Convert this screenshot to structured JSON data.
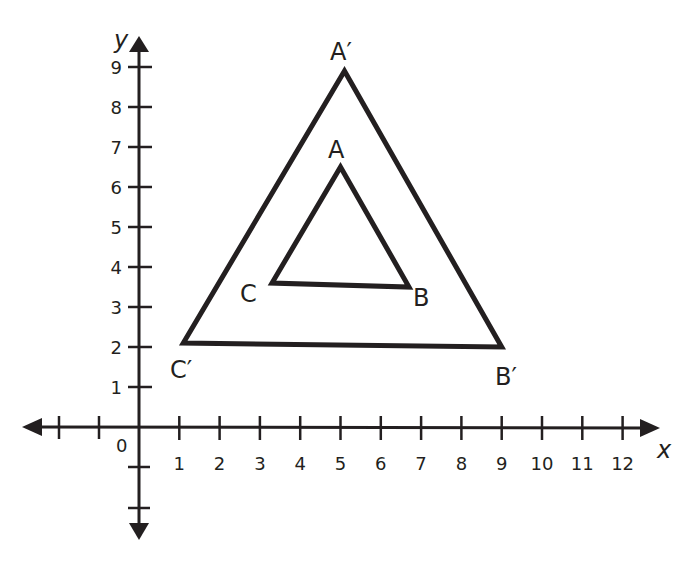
{
  "diagram": {
    "type": "coordinate-plane-dilation",
    "colors": {
      "ink": "#231f20",
      "background": "#ffffff"
    },
    "axes": {
      "x_label": "x",
      "y_label": "y",
      "origin_label": "0",
      "x_ticks": [
        "1",
        "2",
        "3",
        "4",
        "5",
        "6",
        "7",
        "8",
        "9",
        "10",
        "11",
        "12"
      ],
      "y_ticks": [
        "1",
        "2",
        "3",
        "4",
        "5",
        "6",
        "7",
        "8",
        "9"
      ],
      "x_range": [
        -3,
        12.8
      ],
      "y_range": [
        -2.5,
        9.7
      ]
    },
    "triangles": [
      {
        "name": "ABC",
        "vertices": [
          {
            "label": "A",
            "x": 5,
            "y": 6.5
          },
          {
            "label": "B",
            "x": 6.7,
            "y": 3.5
          },
          {
            "label": "C",
            "x": 3.3,
            "y": 3.6
          }
        ]
      },
      {
        "name": "A'B'C'",
        "vertices": [
          {
            "label": "A′",
            "x": 5.1,
            "y": 8.9
          },
          {
            "label": "B′",
            "x": 9,
            "y": 2
          },
          {
            "label": "C′",
            "x": 1.1,
            "y": 2.1
          }
        ]
      }
    ]
  }
}
